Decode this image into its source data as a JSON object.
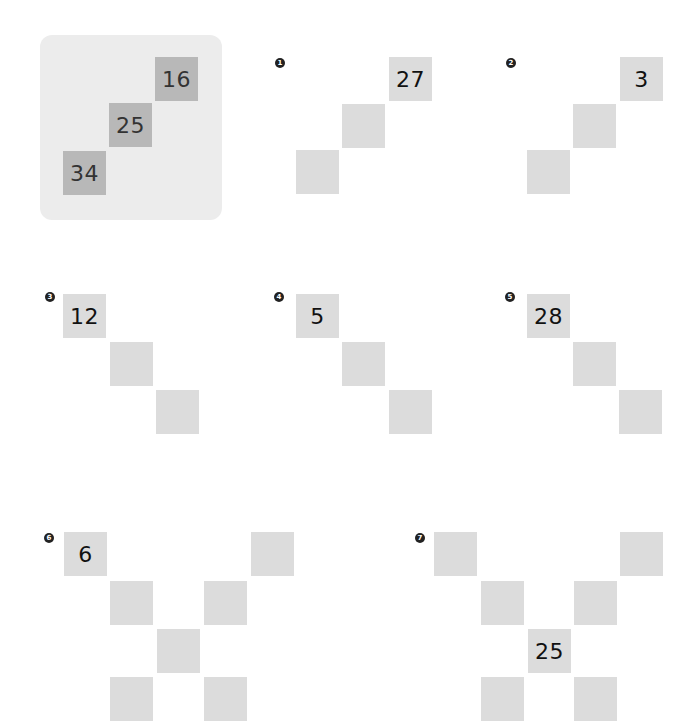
{
  "example": {
    "squares": [
      {
        "value": "16",
        "x": 155,
        "y": 57
      },
      {
        "value": "25",
        "x": 109,
        "y": 103
      },
      {
        "value": "34",
        "x": 63,
        "y": 151
      }
    ]
  },
  "puzzles": [
    {
      "number": "1",
      "badge": {
        "x": 275,
        "y": 58
      },
      "squares": [
        {
          "value": "27",
          "x": 389,
          "y": 57
        },
        {
          "value": "",
          "x": 342,
          "y": 104
        },
        {
          "value": "",
          "x": 296,
          "y": 150
        }
      ]
    },
    {
      "number": "2",
      "badge": {
        "x": 506,
        "y": 58
      },
      "squares": [
        {
          "value": "3",
          "x": 620,
          "y": 57
        },
        {
          "value": "",
          "x": 573,
          "y": 104
        },
        {
          "value": "",
          "x": 527,
          "y": 150
        }
      ]
    },
    {
      "number": "3",
      "badge": {
        "x": 45,
        "y": 292
      },
      "squares": [
        {
          "value": "12",
          "x": 63,
          "y": 294
        },
        {
          "value": "",
          "x": 110,
          "y": 342
        },
        {
          "value": "",
          "x": 156,
          "y": 390
        }
      ]
    },
    {
      "number": "4",
      "badge": {
        "x": 274,
        "y": 292
      },
      "squares": [
        {
          "value": "5",
          "x": 296,
          "y": 294
        },
        {
          "value": "",
          "x": 342,
          "y": 342
        },
        {
          "value": "",
          "x": 389,
          "y": 390
        }
      ]
    },
    {
      "number": "5",
      "badge": {
        "x": 505,
        "y": 292
      },
      "squares": [
        {
          "value": "28",
          "x": 527,
          "y": 294
        },
        {
          "value": "",
          "x": 573,
          "y": 342
        },
        {
          "value": "",
          "x": 619,
          "y": 390
        }
      ]
    },
    {
      "number": "6",
      "badge": {
        "x": 44,
        "y": 533
      },
      "squares": [
        {
          "value": "6",
          "x": 64,
          "y": 532
        },
        {
          "value": "",
          "x": 110,
          "y": 581
        },
        {
          "value": "",
          "x": 157,
          "y": 629
        },
        {
          "value": "",
          "x": 204,
          "y": 581
        },
        {
          "value": "",
          "x": 251,
          "y": 532
        },
        {
          "value": "",
          "x": 110,
          "y": 677
        },
        {
          "value": "",
          "x": 204,
          "y": 677
        }
      ]
    },
    {
      "number": "7",
      "badge": {
        "x": 415,
        "y": 533
      },
      "squares": [
        {
          "value": "",
          "x": 434,
          "y": 532
        },
        {
          "value": "",
          "x": 481,
          "y": 581
        },
        {
          "value": "25",
          "x": 528,
          "y": 629
        },
        {
          "value": "",
          "x": 574,
          "y": 581
        },
        {
          "value": "",
          "x": 620,
          "y": 532
        },
        {
          "value": "",
          "x": 481,
          "y": 677
        },
        {
          "value": "",
          "x": 574,
          "y": 677
        }
      ]
    }
  ],
  "colors": {
    "example_bg": "#ececec",
    "example_square": "#b8b8b8",
    "puzzle_square": "#dcdcdc",
    "badge": "#222222"
  }
}
